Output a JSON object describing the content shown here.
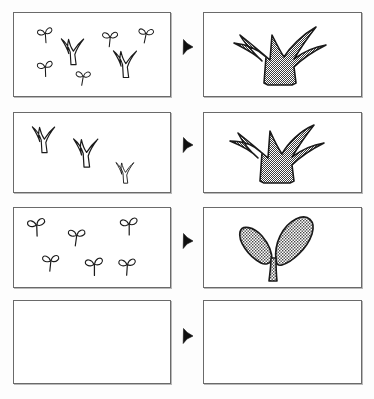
{
  "figure": {
    "background_color": "#fdfdfd",
    "panel_border_color": "#6a6a6a",
    "panel_fill_color": "#ffffff",
    "arrow_color": "#101010",
    "outline_color": "#1a1a1a",
    "stipple_color": "#4a4a4a",
    "stipple_description": "fine checkerboard stipple fill (~50% gray)",
    "rows": 4,
    "columns": 3,
    "column_roles": [
      "observed-specimens",
      "arrow",
      "representative-plant"
    ]
  },
  "rows": [
    {
      "index": 1,
      "label": "row-1",
      "left_panel": {
        "name": "observation-panel-1",
        "empty": false,
        "specimen_count": 7,
        "specimens": [
          {
            "type": "seedling",
            "x": 22,
            "y": 14,
            "scale": 0.78,
            "rot": -6
          },
          {
            "type": "seedling",
            "x": 88,
            "y": 16,
            "scale": 0.8,
            "rot": 4
          },
          {
            "type": "seedling",
            "x": 125,
            "y": 12,
            "scale": 0.78,
            "rot": 10
          },
          {
            "type": "seedling",
            "x": 22,
            "y": 47,
            "scale": 0.8,
            "rot": -4
          },
          {
            "type": "seedling",
            "x": 62,
            "y": 55,
            "scale": 0.76,
            "rot": 8
          },
          {
            "type": "grass",
            "x": 45,
            "y": 24,
            "scale": 0.92,
            "rot": 0
          },
          {
            "type": "grass",
            "x": 97,
            "y": 36,
            "scale": 0.95,
            "rot": 0
          }
        ]
      },
      "arrow": {
        "name": "arrow-1",
        "direction": "right",
        "visible": true
      },
      "right_panel": {
        "name": "result-panel-1",
        "empty": false,
        "plant": {
          "type": "grass-tuft",
          "filled": true,
          "leaves": 4
        }
      }
    },
    {
      "index": 2,
      "label": "row-2",
      "left_panel": {
        "name": "observation-panel-2",
        "empty": false,
        "specimen_count": 3,
        "specimens": [
          {
            "type": "grass",
            "x": 16,
            "y": 12,
            "scale": 0.92,
            "rot": 0
          },
          {
            "type": "grass",
            "x": 57,
            "y": 24,
            "scale": 1.0,
            "rot": 0
          },
          {
            "type": "grass",
            "x": 100,
            "y": 48,
            "scale": 0.74,
            "rot": 0
          }
        ]
      },
      "arrow": {
        "name": "arrow-2",
        "direction": "right",
        "visible": true
      },
      "right_panel": {
        "name": "result-panel-2",
        "empty": false,
        "plant": {
          "type": "grass-tuft",
          "filled": true,
          "leaves": 4
        }
      }
    },
    {
      "index": 3,
      "label": "row-3",
      "left_panel": {
        "name": "observation-panel-3",
        "empty": false,
        "specimen_count": 6,
        "specimens": [
          {
            "type": "seedling",
            "x": 12,
            "y": 9,
            "scale": 0.92,
            "rot": -4
          },
          {
            "type": "seedling",
            "x": 54,
            "y": 18,
            "scale": 0.88,
            "rot": 6
          },
          {
            "type": "seedling",
            "x": 105,
            "y": 8,
            "scale": 0.9,
            "rot": -2
          },
          {
            "type": "seedling",
            "x": 28,
            "y": 44,
            "scale": 0.86,
            "rot": 4
          },
          {
            "type": "seedling",
            "x": 70,
            "y": 48,
            "scale": 0.92,
            "rot": -2
          },
          {
            "type": "seedling",
            "x": 104,
            "y": 48,
            "scale": 0.88,
            "rot": 2
          }
        ]
      },
      "arrow": {
        "name": "arrow-3",
        "direction": "right",
        "visible": true
      },
      "right_panel": {
        "name": "result-panel-3",
        "empty": false,
        "plant": {
          "type": "dicot-seedling",
          "filled": true,
          "leaves": 2
        }
      }
    },
    {
      "index": 4,
      "label": "row-4",
      "left_panel": {
        "name": "observation-panel-4",
        "empty": true,
        "specimen_count": 0,
        "specimens": []
      },
      "arrow": {
        "name": "arrow-4",
        "direction": "right",
        "visible": true
      },
      "right_panel": {
        "name": "result-panel-4",
        "empty": true,
        "plant": null
      }
    }
  ],
  "geometry": {
    "rows_y": [
      12,
      112,
      207,
      300
    ],
    "rows_h": [
      85,
      81,
      81,
      84
    ],
    "arrow_y": [
      38,
      136,
      232,
      327
    ]
  }
}
